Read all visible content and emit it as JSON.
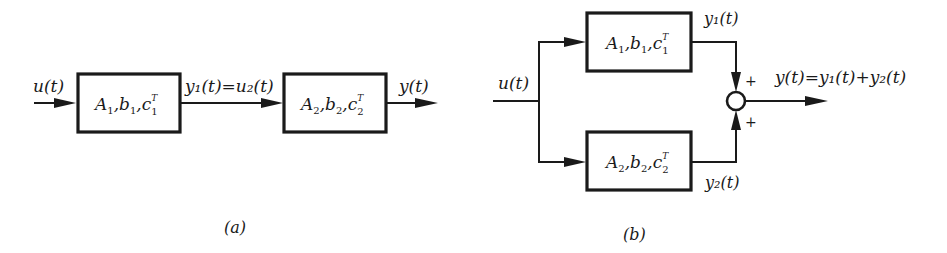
{
  "diagram_a": {
    "caption": "(a)",
    "title": "series connection",
    "input_label": "u(t)",
    "block1": {
      "A": "A",
      "b": "b",
      "c": "c",
      "sub": "1",
      "sup": "T"
    },
    "link_label": "y₁(t)=u₂(t)",
    "block2": {
      "A": "A",
      "b": "b",
      "c": "c",
      "sub": "2",
      "sup": "T"
    },
    "output_label": "y(t)"
  },
  "diagram_b": {
    "caption": "(b)",
    "title": "parallel connection",
    "input_label": "u(t)",
    "block_upper": {
      "A": "A",
      "b": "b",
      "c": "c",
      "sub": "1",
      "sup": "T"
    },
    "block_lower": {
      "A": "A",
      "b": "b",
      "c": "c",
      "sub": "2",
      "sup": "T"
    },
    "upper_output_label": "y₁(t)",
    "lower_output_label": "y₂(t)",
    "sum_sign_upper": "+",
    "sum_sign_lower": "+",
    "output_label": "y(t)=y₁(t)+y₂(t)"
  }
}
